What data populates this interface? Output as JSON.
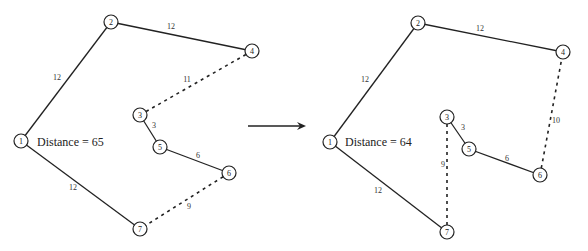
{
  "diagrams": [
    {
      "distance_label": "Distance = 65",
      "nodes": [
        {
          "id": "1",
          "x": 21,
          "y": 141
        },
        {
          "id": "2",
          "x": 111,
          "y": 22
        },
        {
          "id": "4",
          "x": 252,
          "y": 51
        },
        {
          "id": "3",
          "x": 140,
          "y": 115
        },
        {
          "id": "5",
          "x": 160,
          "y": 147
        },
        {
          "id": "6",
          "x": 229,
          "y": 173
        },
        {
          "id": "7",
          "x": 140,
          "y": 229
        }
      ],
      "edges": [
        {
          "a": 0,
          "b": 1,
          "w": "12",
          "dashed": false,
          "lx": 57,
          "ly": 80
        },
        {
          "a": 1,
          "b": 2,
          "w": "12",
          "dashed": false,
          "lx": 171,
          "ly": 29
        },
        {
          "a": 2,
          "b": 3,
          "w": "11",
          "dashed": true,
          "lx": 187,
          "ly": 82
        },
        {
          "a": 3,
          "b": 4,
          "w": "3",
          "dashed": false,
          "lx": 154,
          "ly": 128
        },
        {
          "a": 4,
          "b": 5,
          "w": "6",
          "dashed": false,
          "lx": 198,
          "ly": 158
        },
        {
          "a": 5,
          "b": 6,
          "w": "9",
          "dashed": true,
          "lx": 189,
          "ly": 209
        },
        {
          "a": 0,
          "b": 6,
          "w": "12",
          "dashed": false,
          "lx": 73,
          "ly": 190
        }
      ],
      "label_x": 37,
      "label_y": 146
    },
    {
      "distance_label": "Distance = 64",
      "nodes": [
        {
          "id": "1",
          "x": 330,
          "y": 142
        },
        {
          "id": "2",
          "x": 418,
          "y": 23
        },
        {
          "id": "4",
          "x": 563,
          "y": 52
        },
        {
          "id": "3",
          "x": 447,
          "y": 117
        },
        {
          "id": "5",
          "x": 469,
          "y": 149
        },
        {
          "id": "6",
          "x": 540,
          "y": 175
        },
        {
          "id": "7",
          "x": 447,
          "y": 232
        }
      ],
      "edges": [
        {
          "a": 0,
          "b": 1,
          "w": "12",
          "dashed": false,
          "lx": 365,
          "ly": 82
        },
        {
          "a": 1,
          "b": 2,
          "w": "12",
          "dashed": false,
          "lx": 480,
          "ly": 31
        },
        {
          "a": 3,
          "b": 4,
          "w": "3",
          "dashed": false,
          "lx": 463,
          "ly": 130
        },
        {
          "a": 4,
          "b": 5,
          "w": "6",
          "dashed": false,
          "lx": 507,
          "ly": 161
        },
        {
          "a": 5,
          "b": 2,
          "w": "10",
          "dashed": true,
          "lx": 556,
          "ly": 123
        },
        {
          "a": 3,
          "b": 6,
          "w": "9",
          "dashed": true,
          "lx": 443,
          "ly": 167
        },
        {
          "a": 0,
          "b": 6,
          "w": "12",
          "dashed": false,
          "lx": 378,
          "ly": 193
        }
      ],
      "label_x": 345,
      "label_y": 146
    }
  ],
  "arrow": {
    "x1": 248,
    "y1": 126,
    "x2": 306,
    "y2": 126
  }
}
